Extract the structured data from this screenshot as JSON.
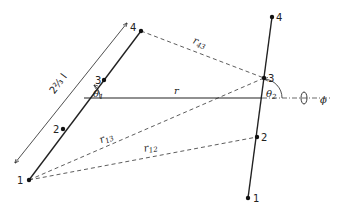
{
  "diagram": {
    "left_rod": {
      "points": [
        {
          "label": "1",
          "x": 29,
          "y": 180
        },
        {
          "label": "2",
          "x": 63,
          "y": 129
        },
        {
          "label": "3",
          "x": 104,
          "y": 80
        },
        {
          "label": "4",
          "x": 141,
          "y": 31
        }
      ],
      "length_label": "2⅔ l"
    },
    "right_rod": {
      "points": [
        {
          "label": "1",
          "x": 248,
          "y": 198
        },
        {
          "label": "2",
          "x": 257,
          "y": 137
        },
        {
          "label": "3",
          "x": 264,
          "y": 78
        },
        {
          "label": "4",
          "x": 272,
          "y": 17
        }
      ]
    },
    "separation_label": "r",
    "angles": {
      "theta1": {
        "symbol": "θ",
        "sub": "1"
      },
      "theta2": {
        "symbol": "θ",
        "sub": "2"
      },
      "phi": "ϕ"
    },
    "distances": [
      {
        "symbol": "r",
        "sub": "43",
        "from": "left-4",
        "to": "right-3"
      },
      {
        "symbol": "r",
        "sub": "13",
        "from": "left-1",
        "to": "right-3"
      },
      {
        "symbol": "r",
        "sub": "12",
        "from": "left-1",
        "to": "right-2"
      }
    ],
    "colors": {
      "ink": "#222222",
      "background": "#ffffff"
    }
  }
}
